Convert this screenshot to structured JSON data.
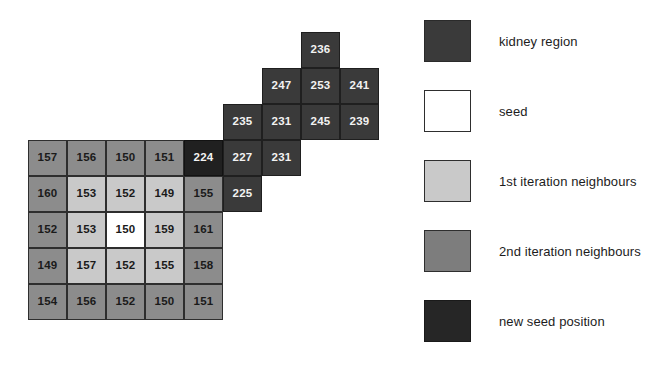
{
  "figure": {
    "name": "region-growing-kidney-segmentation-figure",
    "width": 652,
    "height": 380,
    "background": "#ffffff"
  },
  "chart_data": {
    "type": "heatmap",
    "title": "",
    "xlabel": "",
    "ylabel": "",
    "cell_width": 39,
    "cell_height": 36,
    "origin_x": 28,
    "origin_y": 140,
    "category_colors": {
      "kidney region": "#3a3a3a",
      "seed": "#ffffff",
      "1st iteration neighbours": "#c9c9c9",
      "2nd iteration neighbours": "#8c8c8c",
      "new seed position": "#202020"
    },
    "grid_rows": [
      {
        "row": 0,
        "cells": [
          {
            "col": 7,
            "value": "236",
            "category": "kidney region"
          }
        ]
      },
      {
        "row": 1,
        "cells": [
          {
            "col": 6,
            "value": "247",
            "category": "kidney region"
          },
          {
            "col": 7,
            "value": "253",
            "category": "kidney region"
          },
          {
            "col": 8,
            "value": "241",
            "category": "kidney region"
          }
        ]
      },
      {
        "row": 2,
        "cells": [
          {
            "col": 5,
            "value": "235",
            "category": "kidney region"
          },
          {
            "col": 6,
            "value": "231",
            "category": "kidney region"
          },
          {
            "col": 7,
            "value": "245",
            "category": "kidney region"
          },
          {
            "col": 8,
            "value": "239",
            "category": "kidney region"
          }
        ]
      },
      {
        "row": 3,
        "cells": [
          {
            "col": 0,
            "value": "157",
            "category": "2nd iteration neighbours"
          },
          {
            "col": 1,
            "value": "156",
            "category": "2nd iteration neighbours"
          },
          {
            "col": 2,
            "value": "150",
            "category": "2nd iteration neighbours"
          },
          {
            "col": 3,
            "value": "151",
            "category": "2nd iteration neighbours"
          },
          {
            "col": 4,
            "value": "224",
            "category": "new seed position"
          },
          {
            "col": 5,
            "value": "227",
            "category": "kidney region"
          },
          {
            "col": 6,
            "value": "231",
            "category": "kidney region"
          }
        ]
      },
      {
        "row": 4,
        "cells": [
          {
            "col": 0,
            "value": "160",
            "category": "2nd iteration neighbours"
          },
          {
            "col": 1,
            "value": "153",
            "category": "1st iteration neighbours"
          },
          {
            "col": 2,
            "value": "152",
            "category": "1st iteration neighbours"
          },
          {
            "col": 3,
            "value": "149",
            "category": "1st iteration neighbours"
          },
          {
            "col": 4,
            "value": "155",
            "category": "2nd iteration neighbours"
          },
          {
            "col": 5,
            "value": "225",
            "category": "kidney region"
          }
        ]
      },
      {
        "row": 5,
        "cells": [
          {
            "col": 0,
            "value": "152",
            "category": "2nd iteration neighbours"
          },
          {
            "col": 1,
            "value": "153",
            "category": "1st iteration neighbours"
          },
          {
            "col": 2,
            "value": "150",
            "category": "seed"
          },
          {
            "col": 3,
            "value": "159",
            "category": "1st iteration neighbours"
          },
          {
            "col": 4,
            "value": "161",
            "category": "2nd iteration neighbours"
          }
        ]
      },
      {
        "row": 6,
        "cells": [
          {
            "col": 0,
            "value": "149",
            "category": "2nd iteration neighbours"
          },
          {
            "col": 1,
            "value": "157",
            "category": "1st iteration neighbours"
          },
          {
            "col": 2,
            "value": "152",
            "category": "1st iteration neighbours"
          },
          {
            "col": 3,
            "value": "155",
            "category": "1st iteration neighbours"
          },
          {
            "col": 4,
            "value": "158",
            "category": "2nd iteration neighbours"
          }
        ]
      },
      {
        "row": 7,
        "cells": [
          {
            "col": 0,
            "value": "154",
            "category": "2nd iteration neighbours"
          },
          {
            "col": 1,
            "value": "156",
            "category": "2nd iteration neighbours"
          },
          {
            "col": 2,
            "value": "152",
            "category": "2nd iteration neighbours"
          },
          {
            "col": 3,
            "value": "150",
            "category": "2nd iteration neighbours"
          },
          {
            "col": 4,
            "value": "151",
            "category": "2nd iteration neighbours"
          }
        ]
      }
    ],
    "legend": {
      "position": "right",
      "entries": [
        {
          "label": "kidney region",
          "color": "#3a3a3a",
          "swatch": "sw-kidney"
        },
        {
          "label": "seed",
          "color": "#ffffff",
          "swatch": "sw-seed"
        },
        {
          "label": "1st iteration neighbours",
          "color": "#c9c9c9",
          "swatch": "sw-iter1"
        },
        {
          "label": "2nd iteration neighbours",
          "color": "#7d7d7d",
          "swatch": "sw-iter2"
        },
        {
          "label": "new seed position",
          "color": "#262626",
          "swatch": "sw-newseed"
        }
      ]
    }
  }
}
